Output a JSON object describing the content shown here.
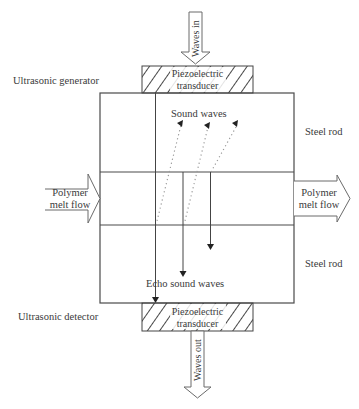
{
  "labels": {
    "waves_in": "Waves in",
    "waves_out": "Waves out",
    "top_transducer_line1": "Piezoelectric",
    "top_transducer_line2": "transducer",
    "bottom_transducer_line1": "Piezoelectric",
    "bottom_transducer_line2": "transducer",
    "ultrasonic_generator": "Ultrasonic generator",
    "ultrasonic_detector": "Ultrasonic detector",
    "steel_rod_top": "Steel rod",
    "steel_rod_bottom": "Steel rod",
    "sound_waves": "Sound waves",
    "echo_sound_waves": "Echo sound waves",
    "polymer_in_line1": "Polymer",
    "polymer_in_line2": "melt flow",
    "polymer_out_line1": "Polymer",
    "polymer_out_line2": "melt flow"
  },
  "colors": {
    "stroke": "#4a4a4a",
    "text": "#3a3a3a",
    "dotted": "#9a9a9a"
  }
}
